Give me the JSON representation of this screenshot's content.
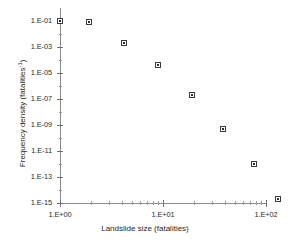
{
  "chart_data": {
    "type": "scatter",
    "title": "",
    "xlabel": "Landslide size (fatalities)",
    "ylabel": "Frequency density (fatalities-1)",
    "ylabel_base": "Frequency density (fatalities",
    "ylabel_sup": "-1",
    "ylabel_close": ")",
    "xscale": "log",
    "yscale": "log",
    "xlim": [
      1,
      100
    ],
    "ylim": [
      1e-15,
      0.1
    ],
    "grid": false,
    "legend": null,
    "x_tick_labels": [
      "1.E+00",
      "1.E+01",
      "1.E+02"
    ],
    "x_tick_values": [
      1,
      10,
      100
    ],
    "y_tick_labels": [
      "1.E-01",
      "1.E-03",
      "1.E-05",
      "1.E-07",
      "1.E-09",
      "1.E-11",
      "1.E-13",
      "1.E-15"
    ],
    "y_tick_values": [
      0.1,
      0.001,
      1e-05,
      1e-07,
      1e-09,
      1e-11,
      1e-13,
      1e-15
    ],
    "marker_style": "open-square",
    "marker_color": "#3b3b3b",
    "x": [
      1.0,
      1.9,
      4.2,
      8.9,
      19,
      38,
      77,
      130
    ],
    "y": [
      0.1,
      0.08,
      0.002,
      4e-05,
      2e-07,
      5e-10,
      1e-12,
      2e-15
    ],
    "points": [
      {
        "x": 1.0,
        "y": 0.1
      },
      {
        "x": 1.9,
        "y": 0.08
      },
      {
        "x": 4.2,
        "y": 0.002
      },
      {
        "x": 8.9,
        "y": 4e-05
      },
      {
        "x": 19,
        "y": 2e-07
      },
      {
        "x": 38,
        "y": 5e-10
      },
      {
        "x": 77,
        "y": 1e-12
      },
      {
        "x": 130,
        "y": 2e-15
      }
    ]
  }
}
